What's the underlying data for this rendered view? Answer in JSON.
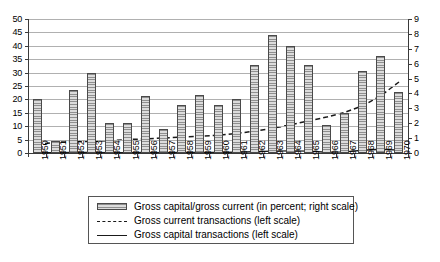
{
  "chart_data": {
    "type": "bar",
    "title": "",
    "xlabel": "",
    "ylabel": "",
    "y2label": "",
    "grid": true,
    "legend_position": "bottom",
    "categories": [
      "1950",
      "1951",
      "1952",
      "1953",
      "1954",
      "1955",
      "1956",
      "1957",
      "1958",
      "1959",
      "1960",
      "1961",
      "1962",
      "1963",
      "1964",
      "1965",
      "1966",
      "1967",
      "1968",
      "1969",
      "1970"
    ],
    "ylim": [
      0,
      50
    ],
    "y_ticks": [
      0,
      5,
      10,
      15,
      20,
      25,
      30,
      35,
      40,
      45,
      50
    ],
    "y2lim": [
      0,
      9
    ],
    "y2_ticks": [
      0,
      1,
      2,
      3,
      4,
      5,
      6,
      7,
      8,
      9
    ],
    "series": [
      {
        "name": "Gross capital/gross current (in percent; right scale)",
        "type": "bar",
        "axis": "right",
        "unit": "percent",
        "values": [
          3.6,
          0.8,
          4.2,
          5.4,
          2.0,
          2.0,
          3.8,
          1.6,
          3.2,
          3.9,
          3.2,
          3.6,
          5.9,
          7.9,
          7.2,
          5.9,
          1.9,
          2.7,
          5.5,
          6.5,
          4.1
        ]
      },
      {
        "name": "Gross current transactions (left scale)",
        "type": "line",
        "style": "dashed",
        "axis": "left",
        "values": [
          3.2,
          4.0,
          4.2,
          4.3,
          4.6,
          5.0,
          5.3,
          5.6,
          6.0,
          6.2,
          6.6,
          7.3,
          8.1,
          9.2,
          10.5,
          12.0,
          13.4,
          15.2,
          17.6,
          21.4,
          26.5
        ]
      },
      {
        "name": "Gross capital transactions (left scale)",
        "type": "line",
        "style": "solid",
        "axis": "left",
        "values": [
          0.1,
          0.1,
          0.2,
          0.2,
          0.1,
          0.1,
          0.2,
          0.1,
          0.2,
          0.2,
          0.2,
          0.3,
          0.5,
          0.7,
          0.8,
          0.7,
          0.3,
          0.4,
          1.0,
          1.4,
          1.1
        ]
      }
    ]
  },
  "legend": {
    "items": [
      {
        "label": "Gross capital/gross current (in percent; right scale)",
        "marker": "bar-swatch"
      },
      {
        "label": "Gross current transactions (left scale)",
        "marker": "dashed-line"
      },
      {
        "label": "Gross capital transactions (left scale)",
        "marker": "solid-line"
      }
    ]
  },
  "caption": {
    "text": ""
  }
}
